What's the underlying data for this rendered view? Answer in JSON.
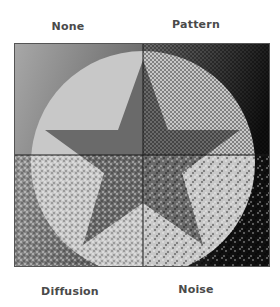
{
  "figure": {
    "quadrants": [
      {
        "id": "none",
        "label": "None",
        "dither": "none"
      },
      {
        "id": "pattern",
        "label": "Pattern",
        "dither": "pattern"
      },
      {
        "id": "diffusion",
        "label": "Diffusion",
        "dither": "diffusion"
      },
      {
        "id": "noise",
        "label": "Noise",
        "dither": "noise"
      }
    ]
  },
  "colors": {
    "background_light": "#a8a8a8",
    "background_dark": "#111111",
    "circle_fill": "#c8c8c8",
    "star_fill": "#6a6a6a",
    "divider": "#1a1a1a",
    "label_text": "#4a4a4a"
  }
}
